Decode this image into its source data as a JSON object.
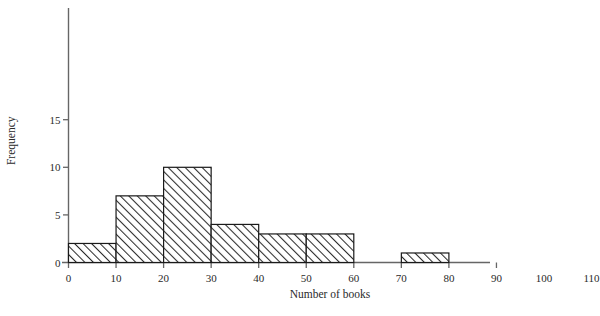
{
  "chart_data": {
    "type": "bar",
    "subtype": "histogram",
    "title": "",
    "xlabel": "Number of books",
    "ylabel": "Frequency",
    "xlim": [
      0,
      110
    ],
    "ylim": [
      0,
      19
    ],
    "grid": false,
    "legend": null,
    "bin_width": 10,
    "bin_edges": [
      0,
      10,
      20,
      30,
      40,
      50,
      60,
      70,
      80,
      90,
      100,
      110
    ],
    "categories": [
      "0-10",
      "10-20",
      "20-30",
      "30-40",
      "40-50",
      "50-60",
      "60-70",
      "70-80",
      "80-90",
      "90-100",
      "100-110"
    ],
    "values": [
      2,
      7,
      10,
      4,
      3,
      3,
      0,
      1,
      0,
      0,
      1
    ],
    "xticks": [
      0,
      10,
      20,
      30,
      40,
      50,
      60,
      70,
      80,
      90,
      100,
      110
    ],
    "xtick_labels": [
      "0",
      "10",
      "20",
      "30",
      "40",
      "50",
      "60",
      "70",
      "80",
      "90",
      "100",
      "110"
    ],
    "yticks": [
      0,
      5,
      10,
      15
    ],
    "ytick_labels": [
      "0",
      "5",
      "10",
      "15"
    ],
    "bar_style": {
      "fill": "hatch-diagonal",
      "edge_color": "#1a1a1a",
      "face_color": "#ffffff"
    },
    "axis_color": "#555555"
  }
}
